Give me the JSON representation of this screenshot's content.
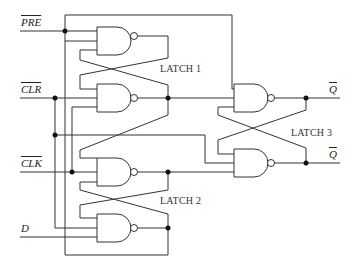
{
  "diagram": {
    "inputs": [
      {
        "label": "PRE",
        "overline": true
      },
      {
        "label": "CLR",
        "overline": true
      },
      {
        "label": "CLK",
        "overline": true
      },
      {
        "label": "D",
        "overline": false
      }
    ],
    "outputs": [
      {
        "label": "Q",
        "overline": true
      },
      {
        "label": "Q",
        "overline": true
      }
    ],
    "latches": [
      {
        "label": "LATCH 1"
      },
      {
        "label": "LATCH 2"
      },
      {
        "label": "LATCH 3"
      }
    ],
    "gate_type": "NAND",
    "gate_count": 6
  }
}
